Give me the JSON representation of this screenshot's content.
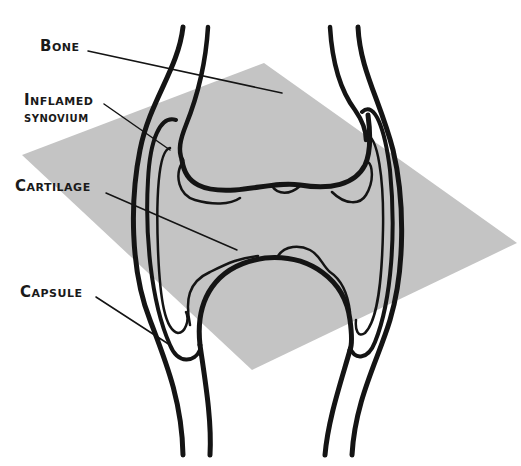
{
  "diagram": {
    "labels": [
      {
        "id": "bone",
        "text": "Bone"
      },
      {
        "id": "inflamed",
        "line1": "Inflamed",
        "line2": "synovium"
      },
      {
        "id": "cartilage",
        "text": "Cartilage"
      },
      {
        "id": "capsule",
        "text": "Capsule"
      }
    ],
    "colors": {
      "plane": "#c4c4c4",
      "stroke": "#141414",
      "background": "#ffffff"
    }
  }
}
